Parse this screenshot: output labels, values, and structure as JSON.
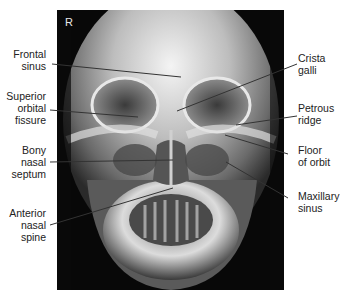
{
  "figure": {
    "type": "frontal skull radiograph (PA view)",
    "side_marker": "R",
    "labels_left": [
      {
        "id": "frontal-sinus",
        "lines": [
          "Frontal",
          "sinus"
        ]
      },
      {
        "id": "superior-orbital-fissure",
        "lines": [
          "Superior",
          "orbital",
          "fissure"
        ]
      },
      {
        "id": "bony-nasal-septum",
        "lines": [
          "Bony",
          "nasal",
          "septum"
        ]
      },
      {
        "id": "anterior-nasal-spine",
        "lines": [
          "Anterior",
          "nasal",
          "spine"
        ]
      }
    ],
    "labels_right": [
      {
        "id": "crista-galli",
        "lines": [
          "Crista",
          "galli"
        ]
      },
      {
        "id": "petrous-ridge",
        "lines": [
          "Petrous",
          "ridge"
        ]
      },
      {
        "id": "floor-of-orbit",
        "lines": [
          "Floor",
          "of orbit"
        ]
      },
      {
        "id": "maxillary-sinus",
        "lines": [
          "Maxillary",
          "sinus"
        ]
      }
    ],
    "colors": {
      "background": "#ffffff",
      "xray_dark": "#080808",
      "label_text": "#222222",
      "leader_line": "#333333"
    }
  }
}
